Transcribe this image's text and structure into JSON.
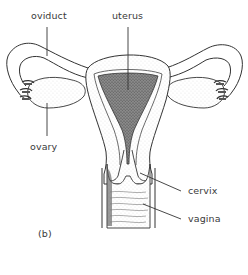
{
  "diagram": {
    "panel_label": "(b)",
    "labels": {
      "oviduct": "oviduct",
      "uterus": "uterus",
      "ovary": "ovary",
      "cervix": "cervix",
      "vagina": "vagina"
    },
    "colors": {
      "line": "#333333",
      "label_text": "#3a3a3a",
      "stipple_dark": "#555555",
      "background": "#ffffff"
    }
  }
}
